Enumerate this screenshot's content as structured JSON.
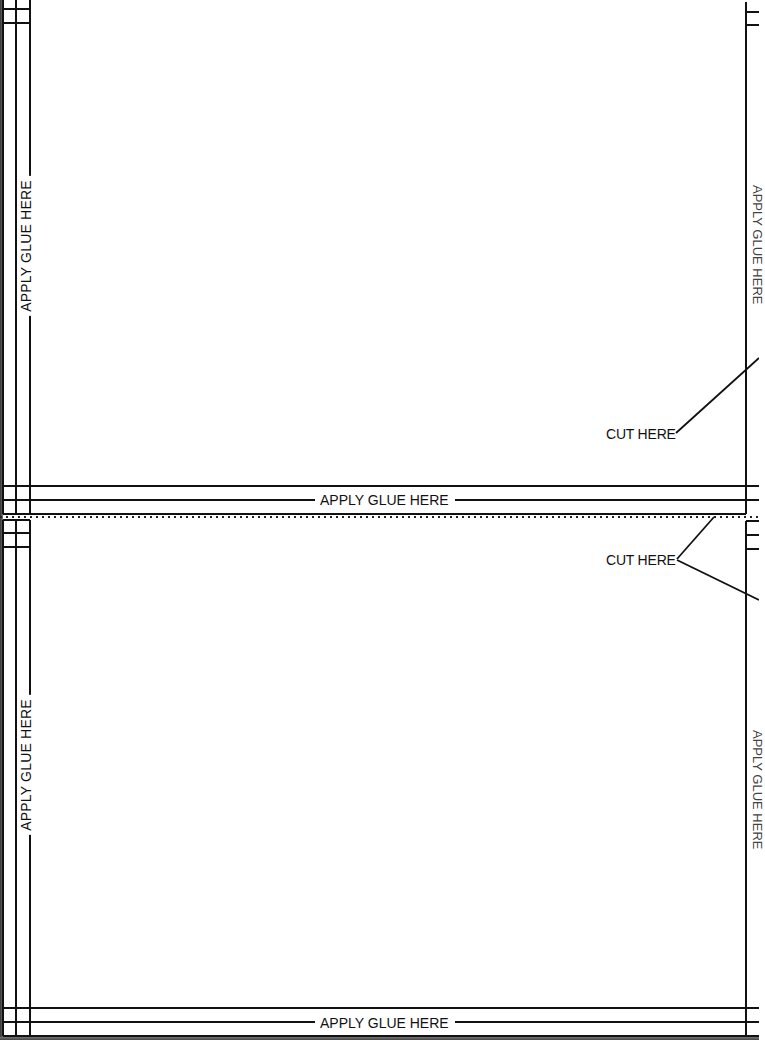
{
  "page": {
    "type": "printed cut-and-glue template sheet",
    "background": "#ffffff",
    "ink_color": "#111111"
  },
  "upper_panel": {
    "left_glue_label": "APPLY GLUE HERE",
    "bottom_glue_label": "APPLY GLUE HERE",
    "right_glue_label_partial": "APPLY GLUE HERE",
    "cut_label": "CUT HERE"
  },
  "separator": {
    "style": "dotted cut line"
  },
  "lower_panel": {
    "left_glue_label": "APPLY GLUE HERE",
    "bottom_glue_label": "APPLY GLUE HERE",
    "right_glue_label_partial": "APPLY GLUE HERE",
    "cut_label": "CUT HERE"
  }
}
